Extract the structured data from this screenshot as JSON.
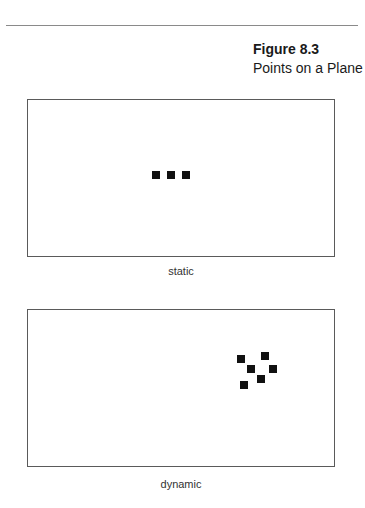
{
  "figure": {
    "number": "Figure 8.3",
    "title": "Points on a Plane"
  },
  "colors": {
    "rule": "#8a8a8a",
    "panel_border": "#5a5a5a",
    "point": "#111111",
    "background": "#ffffff"
  },
  "panels": [
    {
      "id": "static",
      "label": "static",
      "points": [
        {
          "x": 124,
          "y": 71
        },
        {
          "x": 139,
          "y": 71
        },
        {
          "x": 154,
          "y": 71
        }
      ]
    },
    {
      "id": "dynamic",
      "label": "dynamic",
      "points": [
        {
          "x": 209,
          "y": 45
        },
        {
          "x": 233,
          "y": 42
        },
        {
          "x": 219,
          "y": 55
        },
        {
          "x": 241,
          "y": 55
        },
        {
          "x": 229,
          "y": 65
        },
        {
          "x": 212,
          "y": 71
        }
      ]
    }
  ]
}
